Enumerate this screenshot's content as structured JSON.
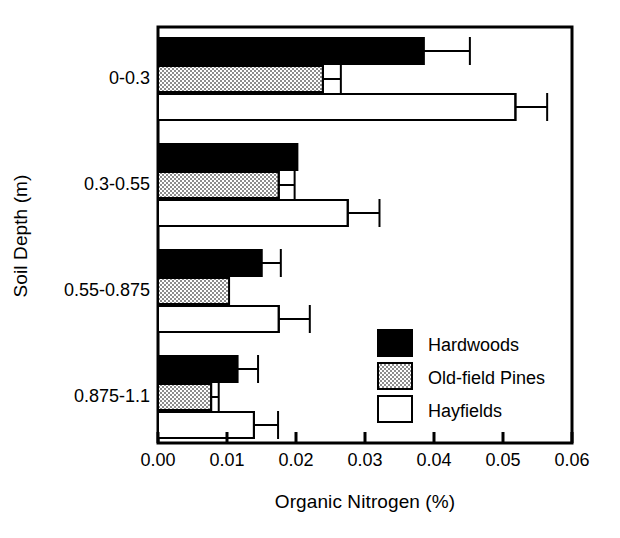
{
  "chart_data": {
    "type": "bar",
    "orientation": "horizontal",
    "title": "",
    "xlabel": "Organic Nitrogen (%)",
    "ylabel": "Soil Depth (m)",
    "categories": [
      "0-0.3",
      "0.3-0.55",
      "0.55-0.875",
      "0.875-1.1"
    ],
    "xlim": [
      0.0,
      0.06
    ],
    "xticks": [
      0.0,
      0.01,
      0.02,
      0.03,
      0.04,
      0.05,
      0.06
    ],
    "xticklabels": [
      "0.00",
      "0.01",
      "0.02",
      "0.03",
      "0.04",
      "0.05",
      "0.06"
    ],
    "grid": false,
    "legend_position": "inside-lower-right",
    "series": [
      {
        "name": "Hardwoods",
        "fill": "#000000",
        "pattern": "solid",
        "values": [
          0.0385,
          0.0202,
          0.015,
          0.0115
        ],
        "errors_upper": [
          0.0452,
          0.0202,
          0.0178,
          0.0145
        ]
      },
      {
        "name": "Old-field Pines",
        "fill": "#c8c8c8",
        "pattern": "stipple",
        "values": [
          0.0239,
          0.0175,
          0.0103,
          0.0077
        ],
        "errors_upper": [
          0.0265,
          0.0198,
          0.0103,
          0.0088
        ]
      },
      {
        "name": "Hayfields",
        "fill": "#ffffff",
        "pattern": "open",
        "values": [
          0.0518,
          0.0275,
          0.0175,
          0.0139
        ],
        "errors_upper": [
          0.0564,
          0.0321,
          0.022,
          0.0174
        ]
      }
    ]
  },
  "legend": {
    "entries": [
      {
        "label": "Hardwoods"
      },
      {
        "label": "Old-field Pines"
      },
      {
        "label": "Hayfields"
      }
    ]
  },
  "axes": {
    "x_title": "Organic Nitrogen (%)",
    "y_title": "Soil Depth (m)",
    "x_tick_labels": [
      "0.00",
      "0.01",
      "0.02",
      "0.03",
      "0.04",
      "0.05",
      "0.06"
    ],
    "y_tick_labels": [
      "0-0.3",
      "0.3-0.55",
      "0.55-0.875",
      "0.875-1.1"
    ]
  },
  "style": {
    "axis_color": "#000000",
    "hardwoods_color": "#000000",
    "oldfield_pines_color": "#c8c8c8",
    "hayfields_color": "#ffffff",
    "background": "#ffffff"
  }
}
